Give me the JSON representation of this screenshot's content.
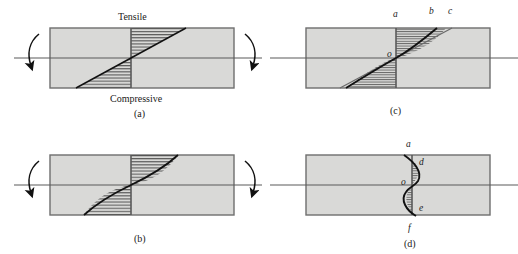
{
  "figure": {
    "type": "engineering-diagram",
    "fill_color": "#d9d9d7",
    "outline_color": "#6e6e6e",
    "curve_color": "#111111",
    "hatch_color": "#4a4a4a",
    "background": "#ffffff"
  },
  "panels": [
    {
      "id": "a",
      "caption": "(a)",
      "top_label": "Tensile",
      "bottom_label": "Compressive",
      "distribution": "linear",
      "has_moment_arrows": true,
      "point_labels": []
    },
    {
      "id": "b",
      "caption": "(b)",
      "top_label": "",
      "bottom_label": "",
      "distribution": "sigmoid",
      "has_moment_arrows": true,
      "point_labels": []
    },
    {
      "id": "c",
      "caption": "(c)",
      "top_label": "",
      "bottom_label": "",
      "distribution": "sigmoid-with-chord",
      "has_moment_arrows": false,
      "point_labels": [
        {
          "text": "a",
          "x": 395,
          "y": 17
        },
        {
          "text": "b",
          "x": 431,
          "y": 14
        },
        {
          "text": "c",
          "x": 450,
          "y": 14
        },
        {
          "text": "o",
          "x": 393,
          "y": 62
        }
      ]
    },
    {
      "id": "d",
      "caption": "(d)",
      "top_label": "",
      "bottom_label": "",
      "distribution": "double-curve",
      "has_moment_arrows": false,
      "point_labels": [
        {
          "text": "a",
          "x": 409,
          "y": 148
        },
        {
          "text": "d",
          "x": 421,
          "y": 165
        },
        {
          "text": "o",
          "x": 404,
          "y": 189
        },
        {
          "text": "e",
          "x": 421,
          "y": 212
        },
        {
          "text": "f",
          "x": 410,
          "y": 232
        }
      ]
    }
  ],
  "captions": {
    "a": "(a)",
    "b": "(b)",
    "c": "(c)",
    "d": "(d)"
  },
  "words": {
    "tensile": "Tensile",
    "compressive": "Compressive"
  }
}
